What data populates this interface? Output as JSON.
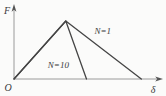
{
  "figure": {
    "axes": {
      "y_label": "F",
      "x_label": "δ",
      "origin_label": "O"
    },
    "colors": {
      "curve": "#454545",
      "axis": "#9a9a9a",
      "text": "#3a3a3a",
      "background": "#fbfbfa"
    }
  },
  "chart_data": {
    "type": "line",
    "title": "",
    "xlabel": "δ",
    "ylabel": "F",
    "xlim": [
      0,
      1
    ],
    "ylim": [
      0,
      1.28
    ],
    "grid": false,
    "legend": "inline annotations",
    "ticks": "none (schematic, unitless axes)",
    "series": [
      {
        "name": "N=1",
        "points": [
          [
            0,
            0
          ],
          [
            0.35,
            1
          ],
          [
            0.86,
            0
          ]
        ]
      },
      {
        "name": "N=10",
        "points": [
          [
            0,
            0
          ],
          [
            0.35,
            1
          ],
          [
            0.49,
            0
          ]
        ]
      }
    ],
    "annotations": [
      {
        "text": "N=1",
        "x": 0.6,
        "y": 0.83
      },
      {
        "text": "N=10",
        "x": 0.3,
        "y": 0.24
      }
    ]
  }
}
